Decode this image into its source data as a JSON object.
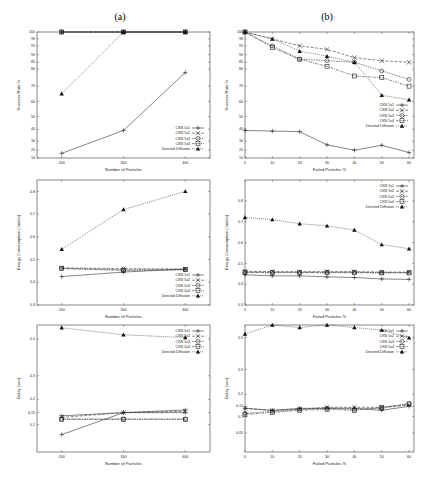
{
  "column_titles": [
    "(a)",
    "(b)"
  ],
  "legend_entries": [
    "CKN 5x1",
    "CKN 5x2",
    "CKN 5x3",
    "CKN 5x4",
    "Directed Diffusion"
  ],
  "chart_data": [
    {
      "id": "a1",
      "type": "line",
      "title": "",
      "xlabel": "Number of Particles",
      "ylabel": "Success Rate %",
      "x": [
        200,
        300,
        400
      ],
      "xticks": [
        200,
        300,
        400
      ],
      "yticks": [
        10,
        20,
        30,
        40,
        50,
        60,
        70,
        80,
        85,
        90,
        95,
        98,
        100
      ],
      "yscale": "compressed-top (stretched near 100)",
      "legend_position": "lower right",
      "grid": false,
      "series": [
        {
          "name": "CKN 5x1",
          "values": [
            100,
            100,
            100
          ]
        },
        {
          "name": "CKN 5x2",
          "values": [
            100,
            100,
            100
          ]
        },
        {
          "name": "CKN 5x3",
          "values": [
            100,
            100,
            100
          ]
        },
        {
          "name": "CKN 5x4",
          "values": [
            100,
            100,
            100
          ]
        },
        {
          "name": "Directed Diffusion",
          "values": [
            65,
            100,
            100
          ]
        },
        {
          "name": "(unlabeled solid line)",
          "values": [
            16,
            39,
            78
          ]
        }
      ]
    },
    {
      "id": "b1",
      "type": "line",
      "title": "",
      "xlabel": "Failed Particles %",
      "ylabel": "Success Rate %",
      "x": [
        0,
        10,
        20,
        30,
        40,
        50,
        60
      ],
      "xticks": [
        0,
        10,
        20,
        30,
        40,
        50,
        60
      ],
      "yticks": [
        10,
        20,
        30,
        40,
        50,
        60,
        70,
        80,
        85,
        90,
        95,
        98,
        100
      ],
      "legend_position": "center right",
      "grid": false,
      "series": [
        {
          "name": "CKN 5x1",
          "values": [
            39,
            38.5,
            38,
            26,
            20,
            25.5,
            17
          ]
        },
        {
          "name": "CKN 5x2",
          "values": [
            100,
            98,
            95,
            93,
            88,
            86,
            85
          ]
        },
        {
          "name": "CKN 5x3",
          "values": [
            100,
            95,
            87,
            86,
            85,
            79,
            74
          ]
        },
        {
          "name": "CKN 5x4",
          "values": [
            100,
            94,
            87,
            82,
            76,
            75,
            70
          ]
        },
        {
          "name": "Directed Diffusion",
          "values": [
            100,
            98,
            92,
            89,
            85,
            64,
            61
          ]
        }
      ]
    },
    {
      "id": "a2",
      "type": "line",
      "title": "",
      "xlabel": "Number of Particles",
      "ylabel": "Energy Consumption (Joules)",
      "x": [
        200,
        300,
        400
      ],
      "xticks": [
        200,
        300,
        400
      ],
      "yticks": [
        0.3,
        0.4,
        0.5,
        0.6,
        0.7,
        0.8
      ],
      "ylim": [
        0.3,
        0.85
      ],
      "legend_position": "lower right",
      "grid": false,
      "series": [
        {
          "name": "CKN 5x1",
          "values": [
            0.425,
            0.445,
            0.458
          ]
        },
        {
          "name": "CKN 5x2",
          "values": [
            0.463,
            0.46,
            0.458
          ]
        },
        {
          "name": "CKN 5x3",
          "values": [
            0.462,
            0.455,
            0.455
          ]
        },
        {
          "name": "CKN 5x4",
          "values": [
            0.46,
            0.452,
            0.456
          ]
        },
        {
          "name": "Directed Diffusion",
          "values": [
            0.545,
            0.72,
            0.8
          ]
        }
      ]
    },
    {
      "id": "b2",
      "type": "line",
      "title": "",
      "xlabel": "Failed Particles %",
      "ylabel": "Energy Consumption (Joules)",
      "x": [
        0,
        10,
        20,
        30,
        40,
        50,
        60
      ],
      "xticks": [
        0,
        10,
        20,
        30,
        40,
        50,
        60
      ],
      "yticks": [
        0.3,
        0.4,
        0.5,
        0.6,
        0.7,
        0.8
      ],
      "ylim": [
        0.3,
        0.9
      ],
      "legend_position": "upper right",
      "grid": false,
      "series": [
        {
          "name": "CKN 5x1",
          "values": [
            0.445,
            0.44,
            0.44,
            0.435,
            0.432,
            0.425,
            0.423
          ]
        },
        {
          "name": "CKN 5x2",
          "values": [
            0.462,
            0.46,
            0.46,
            0.46,
            0.46,
            0.458,
            0.458
          ]
        },
        {
          "name": "CKN 5x3",
          "values": [
            0.458,
            0.457,
            0.457,
            0.457,
            0.457,
            0.456,
            0.456
          ]
        },
        {
          "name": "CKN 5x4",
          "values": [
            0.456,
            0.455,
            0.455,
            0.455,
            0.455,
            0.454,
            0.454
          ]
        },
        {
          "name": "Directed Diffusion",
          "values": [
            0.72,
            0.71,
            0.69,
            0.68,
            0.66,
            0.59,
            0.57
          ]
        }
      ]
    },
    {
      "id": "a3",
      "type": "line",
      "title": "",
      "xlabel": "Number of Particles",
      "ylabel": "Delay (sec)",
      "x": [
        200,
        300,
        400
      ],
      "xticks": [
        200,
        300,
        400
      ],
      "yticks": [
        0.1,
        0.15,
        0.2,
        0.3,
        0.5
      ],
      "ytick_labels": [
        "0.1",
        "0.15",
        "0.2",
        "0.3",
        "0.5"
      ],
      "legend_position": "upper right",
      "grid": false,
      "series": [
        {
          "name": "CKN 5x1",
          "values": [
            0.14,
            0.15,
            0.16
          ]
        },
        {
          "name": "CKN 5x2",
          "values": [
            0.135,
            0.15,
            0.155
          ]
        },
        {
          "name": "CKN 5x3",
          "values": [
            0.13,
            0.13,
            0.13
          ]
        },
        {
          "name": "CKN 5x4",
          "values": [
            0.128,
            0.128,
            0.128
          ]
        },
        {
          "name": "Directed Diffusion",
          "values": [
            0.58,
            0.53,
            0.51
          ]
        },
        {
          "name": "(unlabeled solid line)",
          "values": [
            0.08,
            0.15,
            0.15
          ]
        }
      ]
    },
    {
      "id": "b3",
      "type": "line",
      "title": "",
      "xlabel": "Failed Particles %",
      "ylabel": "Delay (sec)",
      "x": [
        0,
        10,
        20,
        30,
        40,
        50,
        60
      ],
      "xticks": [
        0,
        10,
        20,
        30,
        40,
        50,
        60
      ],
      "yticks": [
        0.05,
        0.1,
        0.15,
        0.2,
        0.3,
        0.5
      ],
      "legend_position": "upper right",
      "grid": false,
      "series": [
        {
          "name": "CKN 5x1",
          "values": [
            0.14,
            0.13,
            0.14,
            0.14,
            0.14,
            0.13,
            0.15
          ]
        },
        {
          "name": "CKN 5x2",
          "values": [
            0.14,
            0.13,
            0.135,
            0.145,
            0.145,
            0.145,
            0.155
          ]
        },
        {
          "name": "CKN 5x3",
          "values": [
            0.115,
            0.125,
            0.135,
            0.14,
            0.135,
            0.14,
            0.16
          ]
        },
        {
          "name": "CKN 5x4",
          "values": [
            0.11,
            0.12,
            0.13,
            0.135,
            0.13,
            0.145,
            0.16
          ]
        },
        {
          "name": "Directed Diffusion",
          "values": [
            0.53,
            0.6,
            0.58,
            0.6,
            0.58,
            0.56,
            0.5
          ]
        }
      ]
    }
  ]
}
